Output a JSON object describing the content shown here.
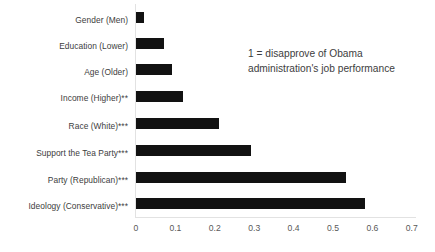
{
  "chart_data": {
    "type": "bar",
    "orientation": "horizontal",
    "title": "",
    "subtitle": "",
    "xlabel": "",
    "ylabel": "",
    "xlim": [
      0,
      0.7
    ],
    "xticks": [
      "0",
      "0.1",
      "0.2",
      "0.3",
      "0.4",
      "0.5",
      "0.6",
      "0.7"
    ],
    "xtick_values": [
      0,
      0.1,
      0.2,
      0.3,
      0.4,
      0.5,
      0.6,
      0.7
    ],
    "grid": false,
    "legend": "none",
    "bar_color": "#121212",
    "axis_color": "#e2e2e2",
    "categories": [
      "Gender (Men)",
      "Education (Lower)",
      "Age (Older)",
      "Income (Higher)**",
      "Race (White)***",
      "Support the Tea Party***",
      "Party (Republican)***",
      "Ideology (Conservative)***"
    ],
    "values": [
      0.02,
      0.07,
      0.09,
      0.12,
      0.21,
      0.29,
      0.53,
      0.58
    ],
    "annotations": [
      "1 = disapprove of Obama administration's job performance"
    ]
  }
}
